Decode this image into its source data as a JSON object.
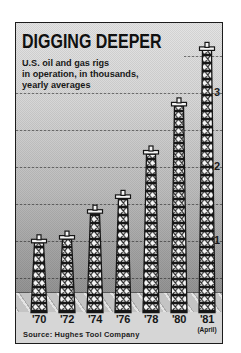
{
  "header": {
    "title": "DIGGING DEEPER",
    "subtitle_lines": [
      "U.S. oil and gas rigs",
      "in operation, in thousands,",
      "yearly averages"
    ]
  },
  "y_axis_labels": [
    "3",
    "2",
    "1"
  ],
  "footer": {
    "source": "Source: Hughes Tool Company"
  },
  "chart_data": {
    "type": "bar",
    "style": "pictorial bars drawn as lattice oil derricks",
    "title": "DIGGING DEEPER",
    "subtitle": "U.S. oil and gas rigs in operation, in thousands, yearly averages",
    "categories": [
      "'70",
      "'72",
      "'74",
      "'76",
      "'78",
      "'80",
      "'81"
    ],
    "category_note": {
      "index": 6,
      "text": "(April)"
    },
    "values": [
      1.05,
      1.1,
      1.45,
      1.65,
      2.25,
      2.9,
      3.65
    ],
    "unit": "thousands of rigs",
    "ylabel": "",
    "xlabel": "",
    "ylim": [
      0,
      3.8
    ],
    "ytick_labels": [
      1,
      2,
      3
    ],
    "gridlines_at": [
      0.5,
      1.0,
      1.5,
      2.0,
      2.5,
      3.0,
      3.5
    ],
    "legend": "none",
    "source": "Source: Hughes Tool Company"
  },
  "colors": {
    "page_background": "#ffffff",
    "ink": "#141414",
    "plot_top": "#e4e4e4",
    "plot_bottom": "#949494",
    "ground_band": "#c4c4c4",
    "label_band": "#d6d6d6",
    "derrick_fill": "#f4f4f4",
    "derrick_lines": "#161616"
  }
}
